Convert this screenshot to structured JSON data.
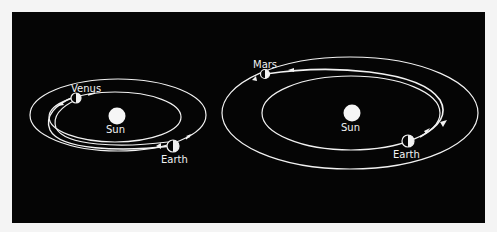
{
  "diagrams": [
    {
      "id": "venus-transfer",
      "labels": {
        "sun": "Sun",
        "inner_planet": "Venus",
        "outer_planet": "Earth"
      }
    },
    {
      "id": "mars-transfer",
      "labels": {
        "sun": "Sun",
        "inner_planet": "Earth",
        "outer_planet": "Mars"
      }
    }
  ],
  "colors": {
    "background": "#050505",
    "page": "#f4f4f4",
    "lines": "#f2f2f2"
  }
}
